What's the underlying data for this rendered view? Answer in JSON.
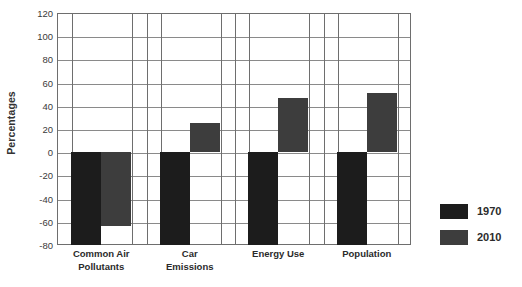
{
  "chart_data": {
    "type": "bar",
    "title": "",
    "subtitle": "",
    "xlabel": "",
    "ylabel": "Percentages",
    "categories": [
      "Common Air\nPollutants",
      "Car\nEmissions",
      "Energy Use",
      "Population"
    ],
    "category_labels": [
      [
        "Common Air",
        "Pollutants"
      ],
      [
        "Car",
        "Emissions"
      ],
      [
        "Energy Use"
      ],
      [
        "Population"
      ]
    ],
    "series": [
      {
        "name": "1970",
        "color": "#1c1c1c",
        "values": [
          -80,
          -80,
          -80,
          -80
        ]
      },
      {
        "name": "2010",
        "color": "#3d3d3d",
        "values": [
          -64,
          25,
          47,
          51
        ]
      }
    ],
    "ylim": [
      -80,
      120
    ],
    "yticks": [
      120,
      100,
      80,
      60,
      40,
      20,
      0,
      -20,
      -40,
      -60,
      -80
    ],
    "ytick_labels": [
      "120",
      "100",
      "80",
      "60",
      "40",
      "20",
      "0",
      "-20",
      "-40",
      "-60",
      "-80"
    ],
    "grid": true,
    "grid_horizontal": true,
    "grid_vertical": true,
    "legend_position": "right",
    "baseline": 0
  },
  "legend": {
    "entries": [
      {
        "label": "1970",
        "color": "#1c1c1c"
      },
      {
        "label": "2010",
        "color": "#3d3d3d"
      }
    ]
  },
  "axis": {
    "y_title": "Percentages"
  },
  "colors": {
    "series_1970": "#1c1c1c",
    "series_2010": "#3d3d3d",
    "grid": "#8a8a8a",
    "frame": "#6e6e6e",
    "text": "#2b2b2b",
    "background": "#ffffff"
  }
}
